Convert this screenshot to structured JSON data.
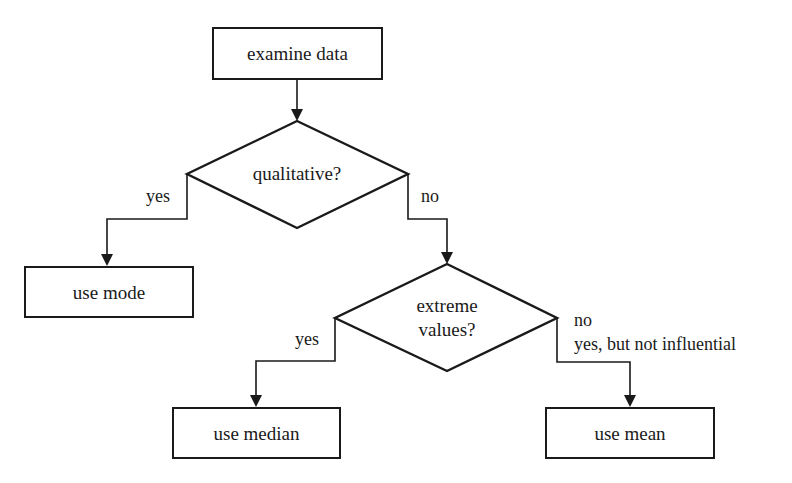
{
  "colors": {
    "stroke": "#1a1a1a",
    "background": "#ffffff",
    "text": "#1a1a1a"
  },
  "nodes": {
    "start": {
      "type": "process",
      "label": "examine data"
    },
    "decision_qualitative": {
      "type": "decision",
      "label": "qualitative?"
    },
    "use_mode": {
      "type": "process",
      "label": "use mode"
    },
    "decision_extreme": {
      "type": "decision",
      "label_line1": "extreme",
      "label_line2": "values?"
    },
    "use_median": {
      "type": "process",
      "label": "use median"
    },
    "use_mean": {
      "type": "process",
      "label": "use mean"
    }
  },
  "edges": {
    "start_to_qualitative": {
      "from": "examine data",
      "to": "qualitative?",
      "label": ""
    },
    "qualitative_yes": {
      "from": "qualitative?",
      "to": "use mode",
      "label": "yes"
    },
    "qualitative_no": {
      "from": "qualitative?",
      "to": "extreme values?",
      "label": "no"
    },
    "extreme_yes": {
      "from": "extreme values?",
      "to": "use median",
      "label": "yes"
    },
    "extreme_no": {
      "from": "extreme values?",
      "to": "use mean",
      "label_line1": "no",
      "label_line2": "yes, but not influential"
    }
  }
}
